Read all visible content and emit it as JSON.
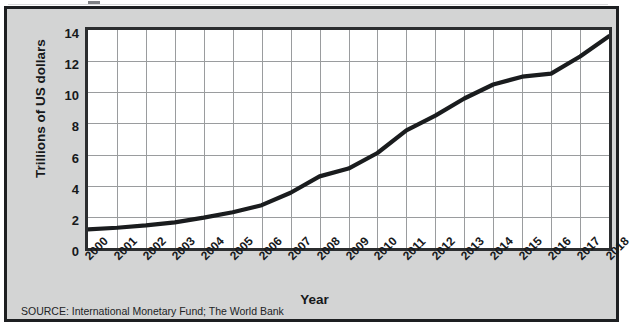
{
  "figure": {
    "background_color": "#d3d4d4",
    "border_color": "#1d1f21",
    "plot_background": "#ffffff",
    "grid_color": "#9a9c9e",
    "series_color": "#1a1c1e"
  },
  "source_note": "SOURCE: International Monetary Fund; The World Bank",
  "chart_data": {
    "type": "line",
    "title": "",
    "xlabel": "Year",
    "ylabel": "Trillions of US dollars",
    "x": [
      "2000",
      "2001",
      "2002",
      "2003",
      "2004",
      "2005",
      "2006",
      "2007",
      "2008",
      "2009",
      "2010",
      "2011",
      "2012",
      "2013",
      "2014",
      "2015",
      "2016",
      "2017",
      "2018"
    ],
    "values": [
      1.2,
      1.3,
      1.45,
      1.65,
      1.95,
      2.3,
      2.75,
      3.55,
      4.6,
      5.1,
      6.1,
      7.55,
      8.5,
      9.6,
      10.5,
      11.0,
      11.2,
      12.3,
      13.6
    ],
    "series": [
      {
        "name": "Gross domestic product",
        "values": [
          1.2,
          1.3,
          1.45,
          1.65,
          1.95,
          2.3,
          2.75,
          3.55,
          4.6,
          5.1,
          6.1,
          7.55,
          8.5,
          9.6,
          10.5,
          11.0,
          11.2,
          12.3,
          13.6
        ]
      }
    ],
    "ylim": [
      0,
      14
    ],
    "yticks": [
      0,
      2,
      4,
      6,
      8,
      10,
      12,
      14
    ],
    "ytick_labels": [
      "0",
      "2",
      "4",
      "6",
      "8",
      "10",
      "12",
      "14"
    ],
    "xlim": [
      "2000",
      "2018"
    ],
    "grid": true,
    "legend": null,
    "legend_position": "none",
    "annotations": []
  }
}
